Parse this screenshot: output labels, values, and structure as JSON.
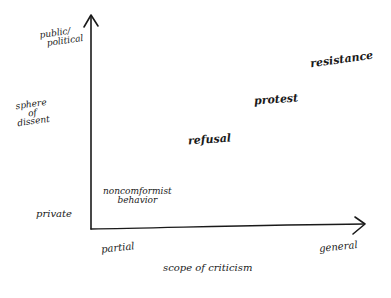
{
  "diagram": {
    "style": "hand-drawn sketch",
    "colors": {
      "ink": "#1a1a1a",
      "background": "#ffffff"
    },
    "y_axis": {
      "title": "sphere of dissent",
      "title_lines": [
        "sphere",
        "of",
        "dissent"
      ],
      "top_label": "public/political",
      "top_label_lines": [
        "public/",
        "political"
      ],
      "bottom_label": "private"
    },
    "x_axis": {
      "title": "scope of criticism",
      "left_label": "partial",
      "right_label": "general"
    },
    "points": [
      {
        "label": "noncomformist behavior",
        "lines": [
          "noncomformist",
          "behavior"
        ],
        "x_rel": "low",
        "y_rel": "low"
      },
      {
        "label": "refusal",
        "x_rel": "low-mid",
        "y_rel": "mid"
      },
      {
        "label": "protest",
        "x_rel": "mid-high",
        "y_rel": "mid-high"
      },
      {
        "label": "resistance",
        "x_rel": "high",
        "y_rel": "high"
      }
    ]
  }
}
